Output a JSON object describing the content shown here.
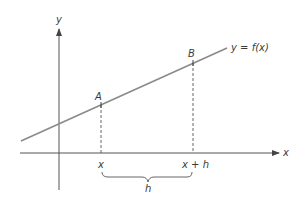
{
  "diagram": {
    "axes": {
      "x_label": "x",
      "y_label": "y"
    },
    "curve": {
      "label": "y = f(x)",
      "color": "#8a8a8a"
    },
    "points": [
      {
        "name": "A",
        "x_label": "x"
      },
      {
        "name": "B",
        "x_label": "x + h"
      }
    ],
    "brace": {
      "label": "h"
    },
    "colors": {
      "axis": "#555555",
      "line": "#8a8a8a",
      "text": "#3a3a3a",
      "dashed": "#555555"
    }
  }
}
